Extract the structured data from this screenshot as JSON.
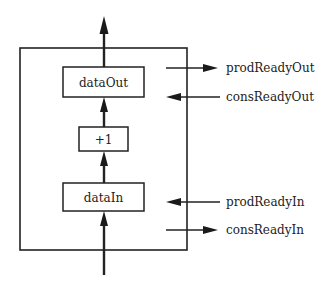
{
  "diagram": {
    "colors": {
      "line": "#222222",
      "background": "#ffffff"
    },
    "container": {
      "name": "module-box"
    },
    "blocks": [
      {
        "id": "dataOut",
        "label": "dataOut"
      },
      {
        "id": "plus_one",
        "label": "+1"
      },
      {
        "id": "dataIn",
        "label": "dataIn"
      }
    ],
    "signals": [
      {
        "id": "prodReadyOut",
        "label": "prodReadyOut",
        "direction": "out"
      },
      {
        "id": "consReadyOut",
        "label": "consReadyOut",
        "direction": "in"
      },
      {
        "id": "prodReadyIn",
        "label": "prodReadyIn",
        "direction": "in"
      },
      {
        "id": "consReadyIn",
        "label": "consReadyIn",
        "direction": "out"
      }
    ],
    "flow": [
      "input",
      "dataIn",
      "+1",
      "dataOut",
      "output"
    ]
  }
}
